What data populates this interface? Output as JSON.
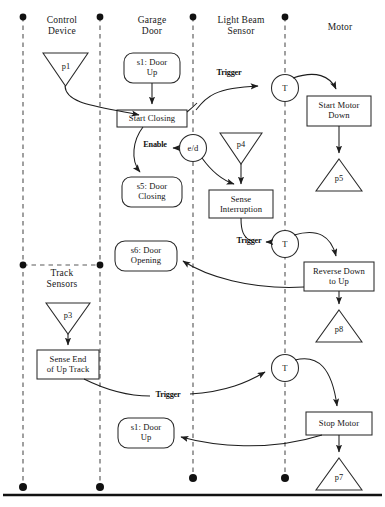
{
  "diagram": {
    "stroke_color": "#2b2b2b",
    "background": "#ffffff"
  },
  "lanes": [
    {
      "id": "control-device",
      "label": "Control\nDevice",
      "x": 23,
      "label_x": 62,
      "label_y": 22
    },
    {
      "id": "garage-door",
      "label": "Garage\nDoor",
      "x": 100,
      "label_x": 152,
      "label_y": 22
    },
    {
      "id": "light-beam-sensor",
      "label": "Light Beam\nSensor",
      "x": 193,
      "label_x": 240,
      "label_y": 22
    },
    {
      "id": "motor",
      "label": "Motor",
      "x": 285,
      "label_x": 340,
      "label_y": 28
    },
    {
      "id": "track-sensors",
      "label": "Track\nSensors",
      "x": 23,
      "label_x": 62,
      "label_y": 273
    }
  ],
  "nodes": [
    {
      "id": "p1",
      "kind": "place-down",
      "label": "p1",
      "cx": 65,
      "cy": 69,
      "w": 45,
      "h": 33
    },
    {
      "id": "s1-door-up-top",
      "kind": "state",
      "label": "s1: Door\nUp",
      "cx": 152,
      "cy": 68,
      "w": 56,
      "h": 30
    },
    {
      "id": "start-closing",
      "kind": "action",
      "label": "Start Closing",
      "cx": 152,
      "cy": 118,
      "w": 70,
      "h": 17
    },
    {
      "id": "e-d",
      "kind": "router",
      "label": "e/d",
      "cx": 193,
      "cy": 148,
      "w": 26,
      "h": 26
    },
    {
      "id": "s5-door-closing",
      "kind": "state",
      "label": "s5: Door\nClosing",
      "cx": 152,
      "cy": 192,
      "w": 60,
      "h": 30
    },
    {
      "id": "p4",
      "kind": "place-down",
      "label": "p4",
      "cx": 241,
      "cy": 148,
      "w": 42,
      "h": 31
    },
    {
      "id": "sense-interruption",
      "kind": "action",
      "label": "Sense\nInterruption",
      "cx": 241,
      "cy": 204,
      "w": 64,
      "h": 28
    },
    {
      "id": "t-top",
      "kind": "router",
      "label": "T",
      "cx": 285,
      "cy": 88,
      "w": 26,
      "h": 26
    },
    {
      "id": "start-motor-down",
      "kind": "action",
      "label": "Start Motor\nDown",
      "cx": 339,
      "cy": 111,
      "w": 64,
      "h": 30
    },
    {
      "id": "p5",
      "kind": "place-up",
      "label": "p5",
      "cx": 339,
      "cy": 175,
      "w": 46,
      "h": 32
    },
    {
      "id": "s6-door-opening",
      "kind": "state",
      "label": "s6: Door\nOpening",
      "cx": 146,
      "cy": 256,
      "w": 62,
      "h": 30
    },
    {
      "id": "t-mid",
      "kind": "router",
      "label": "T",
      "cx": 285,
      "cy": 244,
      "w": 26,
      "h": 26
    },
    {
      "id": "reverse-down-to-up",
      "kind": "action",
      "label": "Reverse Down\nto Up",
      "cx": 339,
      "cy": 277,
      "w": 70,
      "h": 29
    },
    {
      "id": "p8",
      "kind": "place-up",
      "label": "p8",
      "cx": 339,
      "cy": 326,
      "w": 46,
      "h": 32
    },
    {
      "id": "p3",
      "kind": "place-down",
      "label": "p3",
      "cx": 68,
      "cy": 318,
      "w": 44,
      "h": 31
    },
    {
      "id": "sense-end-of-up-track",
      "kind": "action",
      "label": "Sense End\nof Up Track",
      "cx": 68,
      "cy": 364,
      "w": 62,
      "h": 29
    },
    {
      "id": "t-bottom",
      "kind": "router",
      "label": "T",
      "cx": 285,
      "cy": 368,
      "w": 26,
      "h": 26
    },
    {
      "id": "stop-motor",
      "kind": "action",
      "label": "Stop Motor",
      "cx": 339,
      "cy": 424,
      "w": 66,
      "h": 23
    },
    {
      "id": "p7",
      "kind": "place-up",
      "label": "p7",
      "cx": 339,
      "cy": 474,
      "w": 46,
      "h": 32
    },
    {
      "id": "s1-door-up-bottom",
      "kind": "state",
      "label": "s1: Door\nUp",
      "cx": 146,
      "cy": 433,
      "w": 56,
      "h": 30
    }
  ],
  "edge_labels": [
    {
      "id": "trigger-1",
      "label": "Trigger",
      "x": 229,
      "y": 73
    },
    {
      "id": "enable",
      "label": "Enable",
      "x": 155,
      "y": 145
    },
    {
      "id": "trigger-2",
      "label": "Trigger",
      "x": 249,
      "y": 240
    },
    {
      "id": "trigger-3",
      "label": "Trigger",
      "x": 168,
      "y": 394
    }
  ],
  "lifeline_dots": [
    {
      "x": 23,
      "y": 17
    },
    {
      "x": 100,
      "y": 17
    },
    {
      "x": 193,
      "y": 17
    },
    {
      "x": 285,
      "y": 17
    },
    {
      "x": 23,
      "y": 265
    },
    {
      "x": 100,
      "y": 265
    },
    {
      "x": 23,
      "y": 487
    },
    {
      "x": 100,
      "y": 487
    },
    {
      "x": 193,
      "y": 478
    },
    {
      "x": 285,
      "y": 478
    }
  ],
  "separators": [
    {
      "id": "track-sensors-divider",
      "x1": 23,
      "y1": 265,
      "x2": 100,
      "y2": 265
    },
    {
      "id": "bottom-rule",
      "x1": 3,
      "y1": 495,
      "x2": 382,
      "y2": 495
    }
  ]
}
